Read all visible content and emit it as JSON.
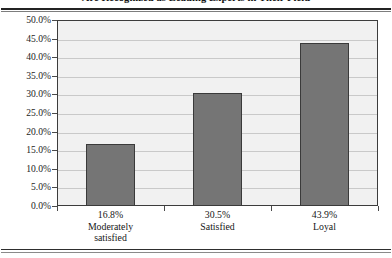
{
  "chart_data": {
    "type": "bar",
    "title": "Are Recognized as Leading Experts in Their Field",
    "xlabel": "",
    "ylabel": "",
    "categories": [
      "Moderately satisfied",
      "Satisfied",
      "Loyal"
    ],
    "category_lines": [
      [
        "Moderately",
        "satisfied"
      ],
      [
        "Satisfied"
      ],
      [
        "Loyal"
      ]
    ],
    "values": [
      16.8,
      30.5,
      43.9
    ],
    "value_labels": [
      "16.8%",
      "30.5%",
      "43.9%"
    ],
    "ylim": [
      0,
      50
    ],
    "ytick_step": 5,
    "ytick_labels": [
      "50.0%",
      "45.0%",
      "40.0%",
      "35.0%",
      "30.0%",
      "25.0%",
      "20.0%",
      "15.0%",
      "10.0%",
      "5.0%",
      "0.0%"
    ],
    "ytick_values": [
      50,
      45,
      40,
      35,
      30,
      25,
      20,
      15,
      10,
      5,
      0
    ],
    "grid": true,
    "legend": null,
    "colors": {
      "bar_fill": "#757575",
      "bar_border": "#3a3a3a",
      "plot_background": "#f1f1f1",
      "plot_border": "#3c3c3c",
      "gridline": "#c9c9c9",
      "text": "#161616",
      "rule": "#2b2b2b"
    }
  }
}
